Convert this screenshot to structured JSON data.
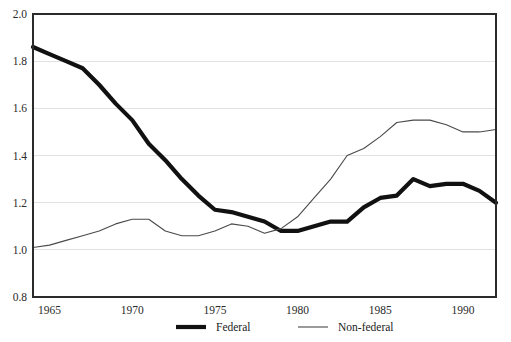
{
  "chart_data": {
    "type": "line",
    "title": "",
    "subtitle": "",
    "xlabel": "",
    "ylabel": "",
    "xlim": [
      1964,
      1992
    ],
    "ylim": [
      0.8,
      2.0
    ],
    "grid": true,
    "grid_axis": "y",
    "legend_position": "bottom-center",
    "x_tick_labels": [
      "1965",
      "1970",
      "1975",
      "1980",
      "1985",
      "1990"
    ],
    "x_ticks": [
      1965,
      1970,
      1975,
      1980,
      1985,
      1990
    ],
    "y_tick_labels": [
      "0.8",
      "1.0",
      "1.2",
      "1.4",
      "1.6",
      "1.8",
      "2.0"
    ],
    "y_ticks": [
      0.8,
      1.0,
      1.2,
      1.4,
      1.6,
      1.8,
      2.0
    ],
    "x": [
      1964,
      1965,
      1966,
      1967,
      1968,
      1969,
      1970,
      1971,
      1972,
      1973,
      1974,
      1975,
      1976,
      1977,
      1978,
      1979,
      1980,
      1981,
      1982,
      1983,
      1984,
      1985,
      1986,
      1987,
      1988,
      1989,
      1990,
      1991,
      1992
    ],
    "series": [
      {
        "name": "Federal",
        "style": "thick",
        "color": "#111111",
        "values": [
          1.86,
          1.83,
          1.8,
          1.77,
          1.7,
          1.62,
          1.55,
          1.45,
          1.38,
          1.3,
          1.23,
          1.17,
          1.16,
          1.14,
          1.12,
          1.08,
          1.08,
          1.1,
          1.12,
          1.12,
          1.18,
          1.22,
          1.23,
          1.3,
          1.27,
          1.28,
          1.28,
          1.25,
          1.2
        ]
      },
      {
        "name": "Non-federal",
        "style": "thin",
        "color": "#4a4a4a",
        "values": [
          1.01,
          1.02,
          1.04,
          1.06,
          1.08,
          1.11,
          1.13,
          1.13,
          1.08,
          1.06,
          1.06,
          1.08,
          1.11,
          1.1,
          1.07,
          1.09,
          1.14,
          1.22,
          1.3,
          1.4,
          1.43,
          1.48,
          1.54,
          1.55,
          1.55,
          1.53,
          1.5,
          1.5,
          1.51
        ]
      }
    ],
    "series_tail": {
      "Federal": [
        1.18,
        1.17,
        1.17,
        1.17
      ],
      "Non-federal": [
        1.51,
        1.52,
        1.52,
        1.52
      ]
    },
    "legend_entries": [
      {
        "label": "Federal",
        "style": "thick"
      },
      {
        "label": "Non-federal",
        "style": "thin"
      }
    ],
    "colors": {
      "background": "#ffffff",
      "frame": "#2b2b2b",
      "gridline": "#d9d9d9",
      "federal": "#111111",
      "nonfederal": "#4a4a4a",
      "text": "#1a1a1a"
    },
    "geometry": {
      "plot_left": 33,
      "plot_right": 496,
      "plot_top": 14,
      "plot_bottom": 297
    }
  }
}
